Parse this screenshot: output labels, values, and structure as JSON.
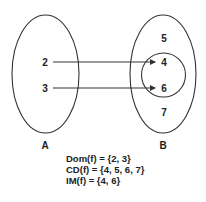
{
  "diagram": {
    "set_a": {
      "label": "A",
      "elements": [
        "2",
        "3"
      ]
    },
    "set_b": {
      "label": "B",
      "elements": [
        "5",
        "4",
        "6",
        "7"
      ],
      "image_subset": [
        "4",
        "6"
      ]
    },
    "mappings": [
      {
        "from": "2",
        "to": "4"
      },
      {
        "from": "3",
        "to": "6"
      }
    ],
    "caption": {
      "domain": "Dom(f) = {2, 3}",
      "codomain": "CD(f) = {4, 5, 6, 7}",
      "image": "IM(f) = {4, 6}"
    }
  }
}
